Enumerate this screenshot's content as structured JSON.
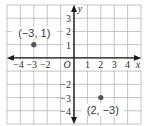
{
  "chart_data": {
    "type": "scatter",
    "title": "",
    "xlabel": "x",
    "ylabel": "y",
    "xlim": [
      -5,
      5
    ],
    "ylim": [
      -5,
      4
    ],
    "grid": true,
    "origin_label": "O",
    "x_ticks": [
      -4,
      -3,
      -2,
      1,
      2,
      3,
      4
    ],
    "x_tick_labels": [
      "−4",
      "−3",
      "−2",
      "1",
      "2",
      "3",
      "4"
    ],
    "y_ticks": [
      3,
      2,
      1,
      -2,
      -3,
      -4
    ],
    "y_tick_labels": [
      "3",
      "2",
      "1",
      "−2",
      "−3",
      "−4"
    ],
    "points": [
      {
        "x": -3,
        "y": 1,
        "label": "(−3, 1)"
      },
      {
        "x": 2,
        "y": -3,
        "label": "(2, −3)"
      }
    ]
  },
  "colors": {
    "grid": "#b5b5b5",
    "axis": "#1a1a1a",
    "point": "#555555",
    "text": "#2a2a2a"
  }
}
